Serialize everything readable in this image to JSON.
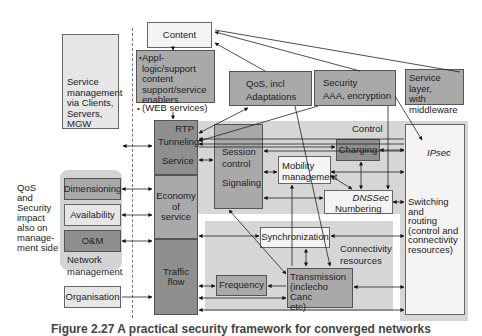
{
  "diagram": {
    "left": {
      "service_management": "Service management via Clients, Servers, MGW",
      "side_note": [
        "QoS",
        "and",
        "Security",
        "impact",
        "also on",
        "manage-",
        "ment side"
      ],
      "network_management": {
        "items": [
          "Dimensioning",
          "Availability",
          "O&M"
        ],
        "label_line1": "Network",
        "label_line2": "management"
      },
      "organisation": "Organisation"
    },
    "top": {
      "content": "Content",
      "appl_logic": [
        "Appl-",
        "logic/support",
        "content",
        "support/service",
        "enablers"
      ],
      "web_services": "(WEB services)",
      "qos": [
        "QoS, incl",
        "Adaptations"
      ],
      "security": [
        "Security",
        "AAA, encryption"
      ],
      "service_layer": [
        "Service layer,",
        "with",
        "middleware"
      ]
    },
    "stack": {
      "rtp": "RTP",
      "tunneling": "Tunneling",
      "service": "Service",
      "economy": [
        "Economy",
        "of",
        "service"
      ],
      "traffic": [
        "Traffic",
        "flow"
      ]
    },
    "control": {
      "label": "Control",
      "session": [
        "Session",
        "control"
      ],
      "signaling": "Signaling",
      "mobility": [
        "Mobility",
        "management"
      ],
      "charging": "Charging",
      "dnssec": "DNSSec",
      "numbering": "Numbering",
      "ipsec": "IPsec",
      "switching": [
        "Switching and",
        "routing",
        "(control  and",
        "connectivity",
        "resources)"
      ]
    },
    "connectivity": {
      "label": [
        "Connectivity",
        "resources"
      ],
      "synchronization": "Synchronization",
      "frequency": "Frequency",
      "transmission": [
        "Transmission",
        "(inclecho Canc",
        "etc)"
      ]
    },
    "caption": "Figure 2.27   A practical security framework for converged networks"
  }
}
